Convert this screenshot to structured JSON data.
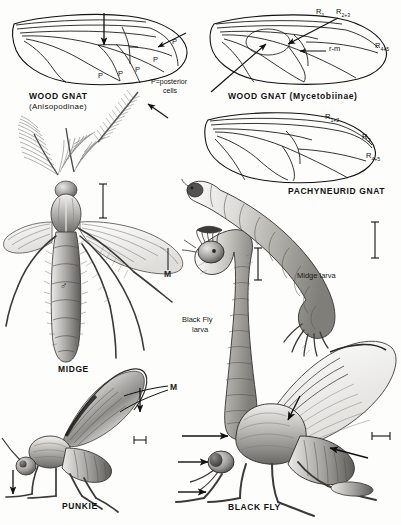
{
  "plate": {
    "background_color": "#fdfdfb",
    "ink_color": "#1a1a1a",
    "description": "Scientific illustration plate of Diptera: wing venation diagrams and habitus drawings"
  },
  "wing_diagrams": [
    {
      "id": "wood-gnat-anisopodinae",
      "caption_line1": "WOOD GNAT",
      "caption_line2": "(Anisopodinae)",
      "cell_labels": [
        "P",
        "P",
        "P",
        "P",
        "P"
      ],
      "legend_line1": "P=posterior",
      "legend_line2": "cells"
    },
    {
      "id": "wood-gnat-mycetobiinae",
      "caption": "WOOD GNAT (Mycetobiinae)",
      "vein_labels": [
        {
          "base": "R",
          "sub": "1"
        },
        {
          "base": "R",
          "sub": "2+3"
        },
        {
          "base": "R",
          "sub": "4+5"
        }
      ],
      "crossvein_label": "r-m"
    },
    {
      "id": "pachyneurid-gnat",
      "caption": "PACHYNEURID GNAT",
      "vein_labels": [
        {
          "base": "R",
          "sub": "1+2"
        },
        {
          "base": "R",
          "sub": "3"
        },
        {
          "base": "R",
          "sub": "4+5"
        }
      ]
    }
  ],
  "figures": [
    {
      "id": "midge",
      "caption": "MIDGE",
      "sex_symbol": "♂",
      "vein_label": "M"
    },
    {
      "id": "black-fly-larva",
      "caption_line1": "Black Fly",
      "caption_line2": "larva"
    },
    {
      "id": "midge-larva",
      "caption": "Midge larva"
    },
    {
      "id": "punkie",
      "caption": "PUNKIE",
      "vein_label": "M"
    },
    {
      "id": "black-fly",
      "caption": "BLACK FLY"
    }
  ]
}
